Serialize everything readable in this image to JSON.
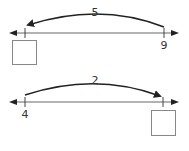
{
  "problems": [
    {
      "jump_label": "5",
      "known_value": "9",
      "unknown_box": "",
      "direction": "left"
    },
    {
      "jump_label": "2",
      "known_value": "4",
      "unknown_box": "",
      "direction": "right"
    }
  ],
  "colors": {
    "line": "#222222",
    "box": "#888888"
  }
}
